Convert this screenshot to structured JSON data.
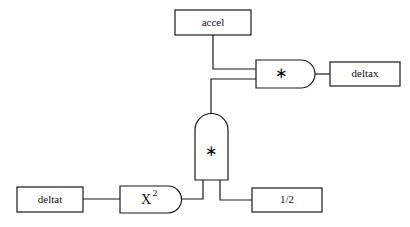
{
  "diagram": {
    "background_color": "#ffffff",
    "line_color": "#1a1a1a",
    "nodes": {
      "accel_box": {
        "label": "accel",
        "kind": "value-box",
        "x": 175,
        "y": 10,
        "w": 76,
        "h": 25
      },
      "deltax_box": {
        "label": "deltax",
        "kind": "value-box",
        "x": 330,
        "y": 62,
        "w": 70,
        "h": 24
      },
      "deltat_box": {
        "label": "deltat",
        "kind": "value-box",
        "x": 17,
        "y": 187,
        "w": 66,
        "h": 25
      },
      "half_box": {
        "label": "1/2",
        "kind": "value-box",
        "x": 252,
        "y": 188,
        "w": 70,
        "h": 24
      },
      "mult_top_gate": {
        "label": "∗",
        "kind": "operator-gate-horizontal",
        "x": 256,
        "y": 60,
        "w": 59,
        "h": 28
      },
      "mult_mid_gate": {
        "label": "∗",
        "kind": "operator-gate-vertical",
        "x": 195,
        "y": 113,
        "w": 33,
        "h": 67
      },
      "square_gate": {
        "label": "X",
        "superscript": "2",
        "kind": "function-gate-horizontal",
        "x": 120,
        "y": 186,
        "w": 62,
        "h": 27
      }
    },
    "wires": [
      {
        "name": "accel-to-mult-top",
        "from": "accel_box",
        "to": "mult_top_gate"
      },
      {
        "name": "mult-mid-to-mult-top",
        "from": "mult_mid_gate",
        "to": "mult_top_gate"
      },
      {
        "name": "mult-top-to-deltax",
        "from": "mult_top_gate",
        "to": "deltax_box"
      },
      {
        "name": "deltat-to-square",
        "from": "deltat_box",
        "to": "square_gate"
      },
      {
        "name": "square-to-mult-mid",
        "from": "square_gate",
        "to": "mult_mid_gate"
      },
      {
        "name": "half-to-mult-mid",
        "from": "half_box",
        "to": "mult_mid_gate"
      }
    ]
  }
}
